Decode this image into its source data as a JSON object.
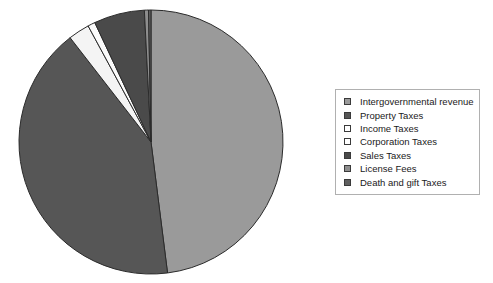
{
  "chart_data": {
    "type": "pie",
    "title": "",
    "legend_position": "right",
    "grid": false,
    "categories": [
      "Intergovernmental revenue",
      "Property Taxes",
      "Income Taxes",
      "Corporation Taxes",
      "Sales Taxes",
      "License Fees",
      "Death and gift Taxes"
    ],
    "values": [
      48.0,
      41.5,
      2.6,
      0.9,
      6.2,
      0.5,
      0.3
    ],
    "colors": [
      "#9a9a9a",
      "#565656",
      "#f4f4f4",
      "#fbfbfb",
      "#4a4a4a",
      "#8e8e8e",
      "#5f5f5f"
    ],
    "slice_border": "#2b2b2b",
    "start_angle": 0,
    "direction": "clockwise",
    "center_x": 151,
    "center_y": 142,
    "radius": 132
  },
  "legend": {
    "items": [
      {
        "label": "Intergovernmental revenue",
        "color": "#9a9a9a"
      },
      {
        "label": "Property Taxes",
        "color": "#565656"
      },
      {
        "label": "Income Taxes",
        "color": "#ffffff"
      },
      {
        "label": "Corporation Taxes",
        "color": "#ffffff"
      },
      {
        "label": "Sales Taxes",
        "color": "#4a4a4a"
      },
      {
        "label": "License Fees",
        "color": "#8e8e8e"
      },
      {
        "label": "Death and gift Taxes",
        "color": "#5f5f5f"
      }
    ]
  }
}
